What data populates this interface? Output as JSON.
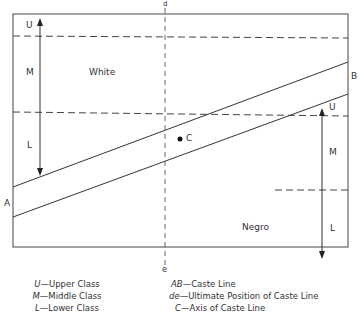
{
  "diagram": {
    "labels": {
      "d": "d",
      "e": "e",
      "A": "A",
      "B": "B",
      "C": "C",
      "white": "White",
      "negro": "Negro",
      "white_U": "U",
      "white_M": "M",
      "white_L": "L",
      "negro_U": "U",
      "negro_M": "M",
      "negro_L": "L"
    },
    "legend_left": [
      {
        "key": "U",
        "text": "—Upper Class"
      },
      {
        "key": "M",
        "text": "—Middle Class"
      },
      {
        "key": "L",
        "text": "—Lower Class"
      }
    ],
    "legend_right": [
      {
        "key": "AB",
        "text": "—Caste Line"
      },
      {
        "key": "de",
        "text": "—Ultimate Position of Caste Line"
      },
      {
        "key": "C",
        "text": "—Axis of Caste Line"
      }
    ],
    "colors": {
      "line": "#333333",
      "background": "#ffffff"
    }
  }
}
